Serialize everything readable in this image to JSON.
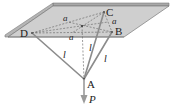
{
  "figure": {
    "colors": {
      "plate_top": "#cfcfcf",
      "plate_edge": "#9a9a9a",
      "plate_outline": "#7a7a7a",
      "rod": "#8c8c8c",
      "dashed": "#6e6e6e",
      "arrow": "#9a9a9a",
      "text": "#222222"
    },
    "points": {
      "D": {
        "label": "D",
        "x": 32,
        "y": 33
      },
      "B": {
        "label": "B",
        "x": 112,
        "y": 32
      },
      "C": {
        "label": "C",
        "x": 104,
        "y": 12
      },
      "O": {
        "label": "",
        "x": 82,
        "y": 26
      },
      "A": {
        "label": "A",
        "x": 84,
        "y": 79
      }
    },
    "labels": {
      "point_D": "D",
      "point_B": "B",
      "point_C": "C",
      "point_A": "A",
      "side_a_top": "a",
      "side_a_right": "a",
      "side_a_bottom": "a",
      "rod_l_left": "l",
      "rod_l_middle": "l",
      "rod_l_right": "l",
      "load": "P"
    }
  }
}
